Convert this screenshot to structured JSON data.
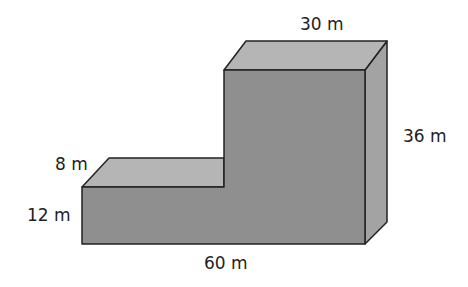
{
  "figure": {
    "colors": {
      "front": "#8f8f8f",
      "top": "#b5b5b5",
      "side": "#a3a3a3",
      "edge": "#222222",
      "background": "#ffffff"
    },
    "labels": {
      "top_width": "30 m",
      "tall_height": "36 m",
      "low_depth": "8 m",
      "low_height": "12 m",
      "total_length": "60 m"
    }
  }
}
